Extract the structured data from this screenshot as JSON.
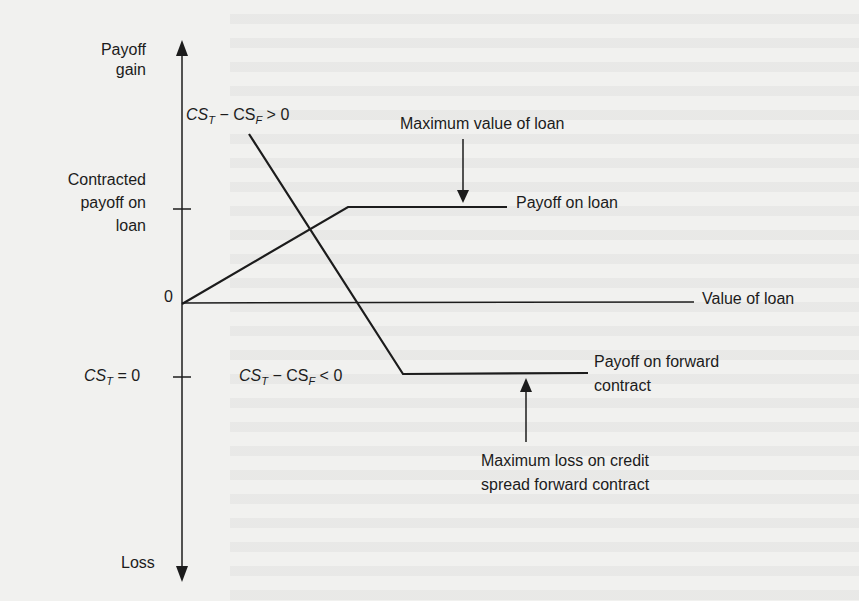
{
  "axis": {
    "top_label_line1": "Payoff",
    "top_label_line2": "gain",
    "bottom_label": "Loss",
    "origin_label": "0",
    "tick_upper_label": [
      "Contracted",
      "payoff on",
      "loan"
    ],
    "tick_lower_label": {
      "main": "CS",
      "sub": "T",
      "rest": " = 0"
    }
  },
  "regions": {
    "upper": {
      "a": "CS",
      "a_sub": "T",
      "op": " − ",
      "b": "CS",
      "b_sub": "F",
      "rest": " > 0"
    },
    "lower": {
      "a": "CS",
      "a_sub": "T",
      "op": " − ",
      "b": "CS",
      "b_sub": "F",
      "rest": " < 0"
    }
  },
  "series_labels": {
    "payoff_on_loan": "Payoff on loan",
    "value_of_loan": "Value of loan",
    "payoff_forward_line1": "Payoff on forward",
    "payoff_forward_line2": "contract"
  },
  "annotations": {
    "max_value": "Maximum value of loan",
    "max_loss_line1": "Maximum loss on credit",
    "max_loss_line2": "spread forward contract"
  },
  "colors": {
    "ink": "#1c1c1c",
    "paper": "#f1f1ef"
  }
}
